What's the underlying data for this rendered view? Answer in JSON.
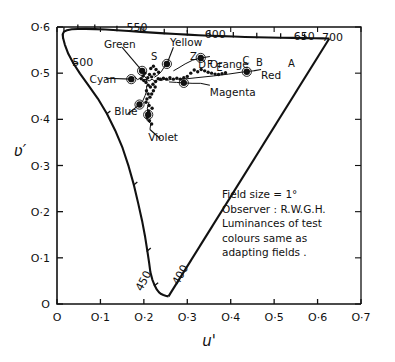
{
  "figure": {
    "kind": "cie-1976-ucs-chromaticity-diagram",
    "ylabel": "ʋ′",
    "xlabel": "u′"
  },
  "annotation": {
    "lines": [
      "Field size = 1°",
      "Observer : R.W.G.H.",
      "Luminances of test",
      "colours same as",
      "adapting fields ."
    ]
  },
  "colors": {
    "ink": "#111111",
    "paper": "#ffffff",
    "locus": "#000000",
    "data": "#000000"
  },
  "chart_data": {
    "type": "scatter",
    "title": "",
    "xlabel": "u'",
    "ylabel": "v'",
    "xlim": [
      0,
      0.7
    ],
    "ylim": [
      0,
      0.6
    ],
    "grid": false,
    "legend": null,
    "xticks": [
      0,
      0.1,
      0.2,
      0.3,
      0.4,
      0.5,
      0.6,
      0.7
    ],
    "xticklabels": [
      "O",
      "O·1",
      "O·2",
      "O·3",
      "O·4",
      "O·5",
      "O·6",
      "O·7"
    ],
    "yticks": [
      0,
      0.1,
      0.2,
      0.3,
      0.4,
      0.5,
      0.6
    ],
    "yticklabels": [
      "O",
      "O·1",
      "O·2",
      "O·3",
      "O·4",
      "O·5",
      "O·6"
    ],
    "wavelength_labels": [
      {
        "text": "500",
        "u": 0.035,
        "v": 0.525,
        "rot": 0
      },
      {
        "text": "550",
        "u": 0.16,
        "v": 0.6,
        "rot": 0
      },
      {
        "text": "600",
        "u": 0.34,
        "v": 0.585,
        "rot": 0
      },
      {
        "text": "650",
        "u": 0.545,
        "v": 0.58,
        "rot": 0
      },
      {
        "text": "700",
        "u": 0.61,
        "v": 0.578,
        "rot": 0
      },
      {
        "text": "450",
        "u": 0.195,
        "v": 0.035,
        "rot": -62
      },
      {
        "text": "400",
        "u": 0.28,
        "v": 0.048,
        "rot": -62
      }
    ],
    "hue_labels": [
      {
        "text": "Green",
        "u": 0.108,
        "v": 0.563
      },
      {
        "text": "Yellow",
        "u": 0.26,
        "v": 0.567
      },
      {
        "text": "Cyan",
        "u": 0.075,
        "v": 0.487
      },
      {
        "text": "Orange",
        "u": 0.352,
        "v": 0.52
      },
      {
        "text": "Red",
        "u": 0.47,
        "v": 0.497
      },
      {
        "text": "Magenta",
        "u": 0.352,
        "v": 0.46
      },
      {
        "text": "Blue",
        "u": 0.132,
        "v": 0.417
      },
      {
        "text": "Violet",
        "u": 0.21,
        "v": 0.362
      }
    ],
    "point_labels": [
      {
        "text": "S",
        "u": 0.224,
        "v": 0.528
      },
      {
        "text": "Z",
        "u": 0.314,
        "v": 0.528
      },
      {
        "text": "F",
        "u": 0.352,
        "v": 0.512
      },
      {
        "text": "E",
        "u": 0.374,
        "v": 0.505
      },
      {
        "text": "D",
        "u": 0.334,
        "v": 0.512
      },
      {
        "text": "C",
        "u": 0.435,
        "v": 0.52
      },
      {
        "text": "B",
        "u": 0.466,
        "v": 0.515
      },
      {
        "text": "A",
        "u": 0.54,
        "v": 0.513
      }
    ],
    "spectral_locus": [
      [
        0.2568,
        0.0165
      ],
      [
        0.254,
        0.017
      ],
      [
        0.25,
        0.018
      ],
      [
        0.245,
        0.0195
      ],
      [
        0.24,
        0.0215
      ],
      [
        0.235,
        0.025
      ],
      [
        0.23,
        0.031
      ],
      [
        0.225,
        0.04
      ],
      [
        0.2195,
        0.053
      ],
      [
        0.215,
        0.069
      ],
      [
        0.212,
        0.09
      ],
      [
        0.208,
        0.115
      ],
      [
        0.203,
        0.145
      ],
      [
        0.196,
        0.18
      ],
      [
        0.187,
        0.218
      ],
      [
        0.177,
        0.258
      ],
      [
        0.165,
        0.298
      ],
      [
        0.151,
        0.338
      ],
      [
        0.134,
        0.376
      ],
      [
        0.115,
        0.412
      ],
      [
        0.094,
        0.445
      ],
      [
        0.072,
        0.474
      ],
      [
        0.053,
        0.499
      ],
      [
        0.038,
        0.521
      ],
      [
        0.026,
        0.542
      ],
      [
        0.018,
        0.562
      ],
      [
        0.014,
        0.576
      ],
      [
        0.013,
        0.584
      ],
      [
        0.016,
        0.59
      ],
      [
        0.023,
        0.593
      ],
      [
        0.034,
        0.595
      ],
      [
        0.048,
        0.5958
      ],
      [
        0.066,
        0.596
      ],
      [
        0.087,
        0.5955
      ],
      [
        0.112,
        0.5945
      ],
      [
        0.138,
        0.593
      ],
      [
        0.165,
        0.5912
      ],
      [
        0.193,
        0.5895
      ],
      [
        0.22,
        0.5878
      ],
      [
        0.247,
        0.5862
      ],
      [
        0.274,
        0.5848
      ],
      [
        0.3,
        0.5835
      ],
      [
        0.326,
        0.5822
      ],
      [
        0.352,
        0.5812
      ],
      [
        0.379,
        0.5802
      ],
      [
        0.406,
        0.5793
      ],
      [
        0.433,
        0.5785
      ],
      [
        0.46,
        0.5778
      ],
      [
        0.488,
        0.5772
      ],
      [
        0.515,
        0.5768
      ],
      [
        0.542,
        0.5764
      ],
      [
        0.57,
        0.576
      ],
      [
        0.593,
        0.5757
      ],
      [
        0.612,
        0.5754
      ],
      [
        0.623,
        0.5752
      ],
      [
        0.627,
        0.5751
      ]
    ],
    "purple_line": [
      [
        0.627,
        0.5751
      ],
      [
        0.2568,
        0.0165
      ]
    ],
    "locus_ticks": [
      {
        "u": 0.016,
        "v": 0.59
      },
      {
        "u": 0.048,
        "v": 0.5958
      },
      {
        "u": 0.087,
        "v": 0.5955
      },
      {
        "u": 0.138,
        "v": 0.593
      },
      {
        "u": 0.193,
        "v": 0.5895
      },
      {
        "u": 0.247,
        "v": 0.5862
      },
      {
        "u": 0.3,
        "v": 0.5835
      },
      {
        "u": 0.352,
        "v": 0.5812
      },
      {
        "u": 0.406,
        "v": 0.5793
      },
      {
        "u": 0.46,
        "v": 0.5778
      },
      {
        "u": 0.515,
        "v": 0.5768
      },
      {
        "u": 0.57,
        "v": 0.576
      },
      {
        "u": 0.014,
        "v": 0.576
      },
      {
        "u": 0.038,
        "v": 0.521
      },
      {
        "u": 0.115,
        "v": 0.412
      },
      {
        "u": 0.177,
        "v": 0.258
      },
      {
        "u": 0.208,
        "v": 0.115
      },
      {
        "u": 0.225,
        "v": 0.04
      }
    ],
    "series": [
      {
        "name": "Green",
        "leader": [
          [
            0.15,
            0.556
          ],
          [
            0.196,
            0.505
          ]
        ],
        "path": [
          [
            0.196,
            0.505
          ],
          [
            0.201,
            0.494
          ],
          [
            0.207,
            0.487
          ],
          [
            0.205,
            0.478
          ]
        ],
        "markers": [
          [
            0.196,
            0.505
          ]
        ]
      },
      {
        "name": "Cyan",
        "leader": [
          [
            0.113,
            0.489
          ],
          [
            0.171,
            0.487
          ]
        ],
        "path": [
          [
            0.171,
            0.487
          ],
          [
            0.179,
            0.492
          ],
          [
            0.186,
            0.486
          ],
          [
            0.192,
            0.49
          ],
          [
            0.198,
            0.483
          ],
          [
            0.205,
            0.487
          ]
        ],
        "markers": [
          [
            0.171,
            0.487
          ]
        ]
      },
      {
        "name": "Blue",
        "leader": [
          [
            0.163,
            0.412
          ],
          [
            0.19,
            0.432
          ]
        ],
        "path": [
          [
            0.19,
            0.432
          ],
          [
            0.198,
            0.441
          ],
          [
            0.203,
            0.452
          ],
          [
            0.207,
            0.463
          ],
          [
            0.206,
            0.472
          ]
        ],
        "markers": [
          [
            0.19,
            0.432
          ]
        ]
      },
      {
        "name": "Violet",
        "leader": [
          [
            0.238,
            0.358
          ],
          [
            0.214,
            0.378
          ]
        ],
        "path": [
          [
            0.214,
            0.378
          ],
          [
            0.216,
            0.391
          ],
          [
            0.207,
            0.398
          ],
          [
            0.21,
            0.41
          ],
          [
            0.208,
            0.424
          ],
          [
            0.212,
            0.438
          ]
        ],
        "markers": [
          [
            0.21,
            0.41
          ]
        ]
      },
      {
        "name": "Yellow",
        "leader": [
          [
            0.268,
            0.556
          ],
          [
            0.253,
            0.52
          ]
        ],
        "path": [
          [
            0.253,
            0.52
          ],
          [
            0.246,
            0.512
          ],
          [
            0.24,
            0.503
          ],
          [
            0.232,
            0.496
          ],
          [
            0.224,
            0.491
          ]
        ],
        "markers": [
          [
            0.253,
            0.52
          ]
        ]
      },
      {
        "name": "Orange",
        "leader": [
          [
            0.352,
            0.536
          ],
          [
            0.331,
            0.533
          ]
        ],
        "path": [
          [
            0.331,
            0.533
          ],
          [
            0.312,
            0.528
          ],
          [
            0.295,
            0.52
          ],
          [
            0.281,
            0.512
          ],
          [
            0.268,
            0.505
          ]
        ],
        "markers": [
          [
            0.331,
            0.533
          ]
        ]
      },
      {
        "name": "Magenta",
        "leader": [
          [
            0.352,
            0.474
          ],
          [
            0.33,
            0.478
          ]
        ],
        "path": [
          [
            0.33,
            0.478
          ],
          [
            0.311,
            0.478
          ],
          [
            0.292,
            0.479
          ],
          [
            0.275,
            0.48
          ],
          [
            0.258,
            0.481
          ]
        ],
        "markers": [
          [
            0.292,
            0.479
          ]
        ]
      },
      {
        "name": "Red",
        "leader": [
          [
            0.47,
            0.508
          ],
          [
            0.452,
            0.505
          ]
        ],
        "path": [
          [
            0.452,
            0.505
          ],
          [
            0.424,
            0.502
          ],
          [
            0.395,
            0.498
          ],
          [
            0.36,
            0.494
          ],
          [
            0.32,
            0.49
          ],
          [
            0.28,
            0.486
          ]
        ],
        "markers": [
          [
            0.437,
            0.503
          ]
        ]
      },
      {
        "name": "cluster-core",
        "leader": null,
        "path": [
          [
            0.205,
            0.487
          ],
          [
            0.212,
            0.483
          ],
          [
            0.219,
            0.487
          ],
          [
            0.226,
            0.482
          ],
          [
            0.232,
            0.487
          ],
          [
            0.24,
            0.484
          ],
          [
            0.248,
            0.487
          ],
          [
            0.256,
            0.485
          ],
          [
            0.264,
            0.487
          ]
        ],
        "markers": []
      }
    ],
    "data_points": [
      [
        0.196,
        0.505
      ],
      [
        0.171,
        0.487
      ],
      [
        0.19,
        0.432
      ],
      [
        0.21,
        0.41
      ],
      [
        0.253,
        0.52
      ],
      [
        0.331,
        0.533
      ],
      [
        0.292,
        0.479
      ],
      [
        0.437,
        0.503
      ],
      [
        0.213,
        0.497
      ],
      [
        0.218,
        0.492
      ],
      [
        0.224,
        0.498
      ],
      [
        0.209,
        0.49
      ],
      [
        0.205,
        0.48
      ],
      [
        0.21,
        0.474
      ],
      [
        0.215,
        0.47
      ],
      [
        0.221,
        0.476
      ],
      [
        0.227,
        0.482
      ],
      [
        0.233,
        0.488
      ],
      [
        0.206,
        0.462
      ],
      [
        0.21,
        0.455
      ],
      [
        0.214,
        0.448
      ],
      [
        0.218,
        0.455
      ],
      [
        0.222,
        0.462
      ],
      [
        0.226,
        0.47
      ],
      [
        0.238,
        0.487
      ],
      [
        0.245,
        0.489
      ],
      [
        0.252,
        0.487
      ],
      [
        0.26,
        0.49
      ],
      [
        0.268,
        0.487
      ],
      [
        0.276,
        0.489
      ],
      [
        0.284,
        0.487
      ],
      [
        0.292,
        0.49
      ],
      [
        0.3,
        0.493
      ],
      [
        0.308,
        0.5
      ],
      [
        0.316,
        0.507
      ],
      [
        0.324,
        0.503
      ],
      [
        0.332,
        0.508
      ],
      [
        0.34,
        0.505
      ],
      [
        0.348,
        0.502
      ],
      [
        0.356,
        0.5
      ],
      [
        0.364,
        0.498
      ],
      [
        0.372,
        0.497
      ],
      [
        0.38,
        0.499
      ],
      [
        0.388,
        0.501
      ],
      [
        0.216,
        0.51
      ],
      [
        0.222,
        0.515
      ],
      [
        0.228,
        0.508
      ],
      [
        0.234,
        0.502
      ],
      [
        0.202,
        0.5
      ],
      [
        0.198,
        0.494
      ],
      [
        0.194,
        0.488
      ],
      [
        0.2,
        0.484
      ],
      [
        0.207,
        0.444
      ],
      [
        0.205,
        0.437
      ],
      [
        0.212,
        0.43
      ],
      [
        0.219,
        0.424
      ],
      [
        0.211,
        0.418
      ],
      [
        0.208,
        0.404
      ],
      [
        0.213,
        0.397
      ],
      [
        0.218,
        0.39
      ]
    ]
  }
}
